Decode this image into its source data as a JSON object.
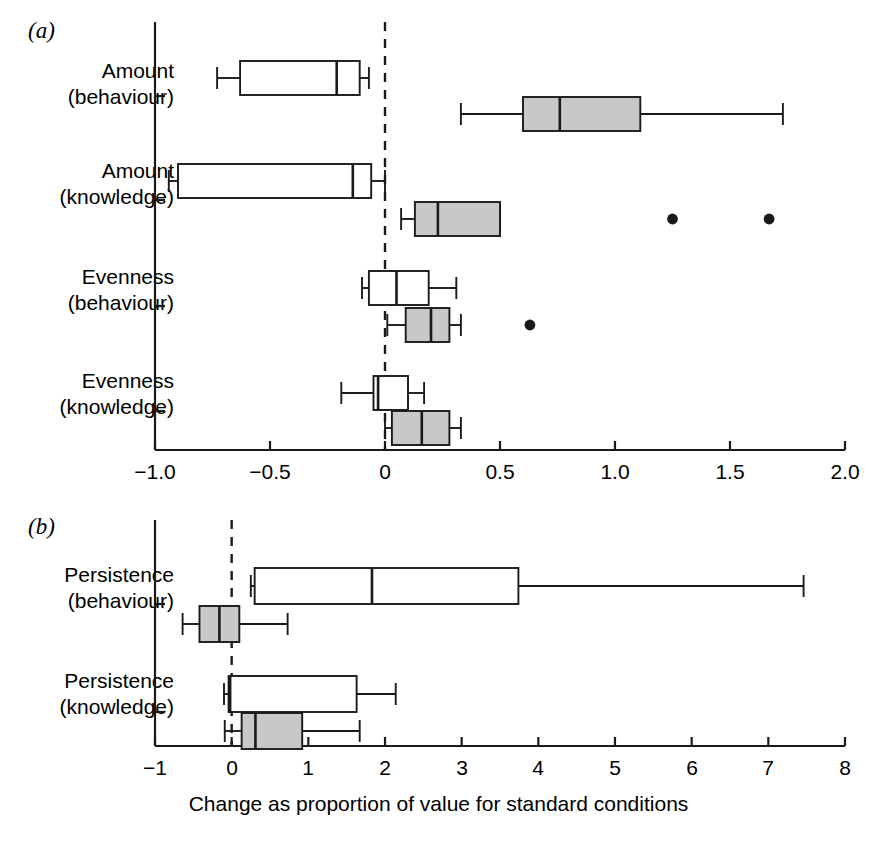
{
  "figure": {
    "background": "#ffffff",
    "line_color": "#1a1a1a",
    "box_fill_open": "#ffffff",
    "box_fill_shaded": "#c8c8c8"
  },
  "panels": [
    {
      "letter": "(a)",
      "axis_label": "",
      "xticklabels": [
        "−1.0",
        "−0.5",
        "0",
        "0.5",
        "1.0",
        "1.5",
        "2.0"
      ],
      "yticklabels": [
        "Amount\n(behaviour)",
        "Amount\n(knowledge)",
        "Evenness\n(behaviour)",
        "Evenness\n(knowledge)"
      ],
      "categories": [
        {
          "line1": "Amount",
          "line2": "(behaviour)"
        },
        {
          "line1": "Amount",
          "line2": "(knowledge)"
        },
        {
          "line1": "Evenness",
          "line2": "(behaviour)"
        },
        {
          "line1": "Evenness",
          "line2": "(knowledge)"
        }
      ]
    },
    {
      "letter": "(b)",
      "axis_label": "Change as proportion of value for standard conditions",
      "xticklabels": [
        "−1",
        "0",
        "1",
        "2",
        "3",
        "4",
        "5",
        "6",
        "7",
        "8"
      ],
      "categories": [
        {
          "line1": "Persistence",
          "line2": "(behaviour)"
        },
        {
          "line1": "Persistence",
          "line2": "(knowledge)"
        }
      ]
    }
  ],
  "chart_data": [
    {
      "type": "box",
      "panel": "(a)",
      "orientation": "horizontal",
      "title": "",
      "xlabel": "",
      "ylabel": "",
      "xlim": [
        -1.0,
        2.0
      ],
      "xticks": [
        -1.0,
        -0.5,
        0,
        0.5,
        1.0,
        1.5,
        2.0
      ],
      "xticklabels": [
        "−1.0",
        "−0.5",
        "0",
        "0.5",
        "1.0",
        "1.5",
        "2.0"
      ],
      "grid": false,
      "reference_line": {
        "value": 0,
        "style": "dashed"
      },
      "categories": [
        "Amount (behaviour)",
        "Amount (knowledge)",
        "Evenness (behaviour)",
        "Evenness (knowledge)"
      ],
      "boxes": [
        {
          "category": "Amount (behaviour)",
          "group": "open",
          "fill": "#ffffff",
          "whisker_low": -0.73,
          "q1": -0.63,
          "median": -0.21,
          "q3": -0.11,
          "whisker_high": -0.07,
          "outliers": []
        },
        {
          "category": "Amount (behaviour)",
          "group": "shaded",
          "fill": "#c8c8c8",
          "whisker_low": 0.33,
          "q1": 0.6,
          "median": 0.76,
          "q3": 1.11,
          "whisker_high": 1.73,
          "outliers": []
        },
        {
          "category": "Amount (knowledge)",
          "group": "open",
          "fill": "#ffffff",
          "whisker_low": -0.94,
          "q1": -0.9,
          "median": -0.14,
          "q3": -0.06,
          "whisker_high": 0.0,
          "outliers": []
        },
        {
          "category": "Amount (knowledge)",
          "group": "shaded",
          "fill": "#c8c8c8",
          "whisker_low": 0.07,
          "q1": 0.13,
          "median": 0.23,
          "q3": 0.5,
          "whisker_high": 0.5,
          "outliers": [
            1.25,
            1.67
          ]
        },
        {
          "category": "Evenness (behaviour)",
          "group": "open",
          "fill": "#ffffff",
          "whisker_low": -0.1,
          "q1": -0.07,
          "median": 0.05,
          "q3": 0.19,
          "whisker_high": 0.31,
          "outliers": []
        },
        {
          "category": "Evenness (behaviour)",
          "group": "shaded",
          "fill": "#c8c8c8",
          "whisker_low": 0.01,
          "q1": 0.09,
          "median": 0.2,
          "q3": 0.28,
          "whisker_high": 0.33,
          "outliers": [
            0.63
          ]
        },
        {
          "category": "Evenness (knowledge)",
          "group": "open",
          "fill": "#ffffff",
          "whisker_low": -0.19,
          "q1": -0.05,
          "median": -0.03,
          "q3": 0.1,
          "whisker_high": 0.17,
          "outliers": []
        },
        {
          "category": "Evenness (knowledge)",
          "group": "shaded",
          "fill": "#c8c8c8",
          "whisker_low": 0.0,
          "q1": 0.03,
          "median": 0.16,
          "q3": 0.28,
          "whisker_high": 0.33,
          "outliers": []
        }
      ]
    },
    {
      "type": "box",
      "panel": "(b)",
      "orientation": "horizontal",
      "title": "",
      "xlabel": "Change as proportion of value for standard conditions",
      "ylabel": "",
      "xlim": [
        -1,
        8
      ],
      "xticks": [
        -1,
        0,
        1,
        2,
        3,
        4,
        5,
        6,
        7,
        8
      ],
      "xticklabels": [
        "−1",
        "0",
        "1",
        "2",
        "3",
        "4",
        "5",
        "6",
        "7",
        "8"
      ],
      "grid": false,
      "reference_line": {
        "value": 0,
        "style": "dashed"
      },
      "categories": [
        "Persistence (behaviour)",
        "Persistence (knowledge)"
      ],
      "boxes": [
        {
          "category": "Persistence (behaviour)",
          "group": "open",
          "fill": "#ffffff",
          "whisker_low": 0.25,
          "q1": 0.3,
          "median": 1.83,
          "q3": 3.74,
          "whisker_high": 7.46,
          "outliers": []
        },
        {
          "category": "Persistence (behaviour)",
          "group": "shaded",
          "fill": "#c8c8c8",
          "whisker_low": -0.64,
          "q1": -0.42,
          "median": -0.16,
          "q3": 0.1,
          "whisker_high": 0.73,
          "outliers": []
        },
        {
          "category": "Persistence (knowledge)",
          "group": "open",
          "fill": "#ffffff",
          "whisker_low": -0.1,
          "q1": -0.04,
          "median": -0.02,
          "q3": 1.63,
          "whisker_high": 2.14,
          "outliers": []
        },
        {
          "category": "Persistence (knowledge)",
          "group": "shaded",
          "fill": "#c8c8c8",
          "whisker_low": -0.09,
          "q1": 0.13,
          "median": 0.31,
          "q3": 0.92,
          "whisker_high": 1.67,
          "outliers": []
        }
      ]
    }
  ]
}
